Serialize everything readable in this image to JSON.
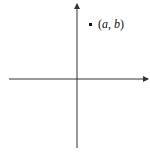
{
  "diagram": {
    "type": "coordinate-plane",
    "point": {
      "label_open": "(",
      "label_a": "a",
      "label_sep": ", ",
      "label_b": "b",
      "label_close": ")",
      "quadrant": "I"
    },
    "colors": {
      "axis": "#333333",
      "point": "#111111",
      "background": "#ffffff"
    }
  }
}
